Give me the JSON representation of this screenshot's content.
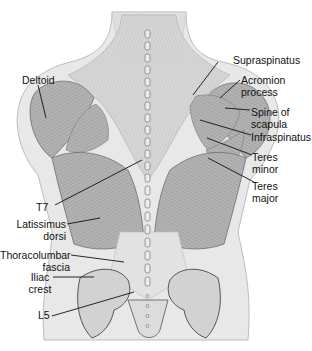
{
  "diagram": {
    "colors": {
      "background": "#ffffff",
      "skin": "#e6e6e6",
      "muscle_light": "#cfcfcf",
      "muscle_dark": "#9a9a9a",
      "bone": "#d9d9d9",
      "leader_line": "#111111",
      "label_text": "#111111"
    },
    "labels": {
      "supraspinatus": "Supraspinatus",
      "acromion_l1": "Acromion",
      "acromion_l2": "process",
      "spine_l1": "Spine of",
      "spine_l2": "scapula",
      "infraspinatus": "Infraspinatus",
      "teres_minor_l1": "Teres",
      "teres_minor_l2": "minor",
      "teres_major_l1": "Teres",
      "teres_major_l2": "major",
      "deltoid": "Deltoid",
      "t7": "T7",
      "latissimus_l1": "Latissimus",
      "latissimus_l2": "dorsi",
      "thoracolumbar_l1": "Thoracolumbar",
      "thoracolumbar_l2": "fascia",
      "iliac_l1": "Iliac",
      "iliac_l2": "crest",
      "l5": "L5"
    }
  }
}
